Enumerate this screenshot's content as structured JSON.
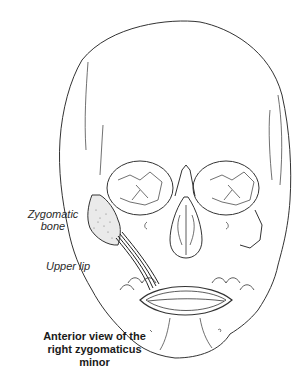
{
  "figure": {
    "type": "anatomical-illustration",
    "labels": {
      "zygomatic_bone_line1": "Zygomatic",
      "zygomatic_bone_line2": "bone",
      "upper_lip": "Upper lip"
    },
    "caption": {
      "line1": "Anterior view of the",
      "line2": "right zygomaticus minor"
    },
    "colors": {
      "line": "#333333",
      "stipple": "#777777",
      "background": "#ffffff"
    }
  }
}
